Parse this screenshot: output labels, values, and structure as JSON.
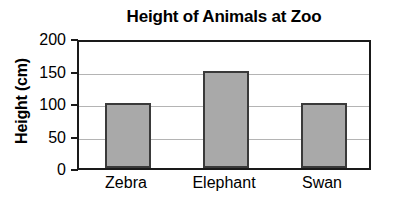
{
  "chart_data": {
    "type": "bar",
    "title": "Height of Animals at Zoo",
    "xlabel": "",
    "ylabel": "Height (cm)",
    "categories": [
      "Zebra",
      "Elephant",
      "Swan"
    ],
    "values": [
      100,
      150,
      100
    ],
    "ylim": [
      0,
      200
    ],
    "yticks": [
      0,
      50,
      100,
      150,
      200
    ],
    "ytick_labels": [
      "0",
      "50",
      "100",
      "150",
      "200"
    ],
    "grid": true,
    "grid_axis": "y",
    "legend": false,
    "legend_position": "none",
    "series": [
      {
        "name": "Height",
        "values": [
          100,
          150,
          100
        ]
      }
    ],
    "colors": {
      "bar_fill": "#a9a9a9",
      "bar_border": "#3a3a3a",
      "gridline": "#b4b4b4",
      "axis": "#1a1a1a",
      "text": "#000000",
      "background": "#ffffff"
    }
  }
}
